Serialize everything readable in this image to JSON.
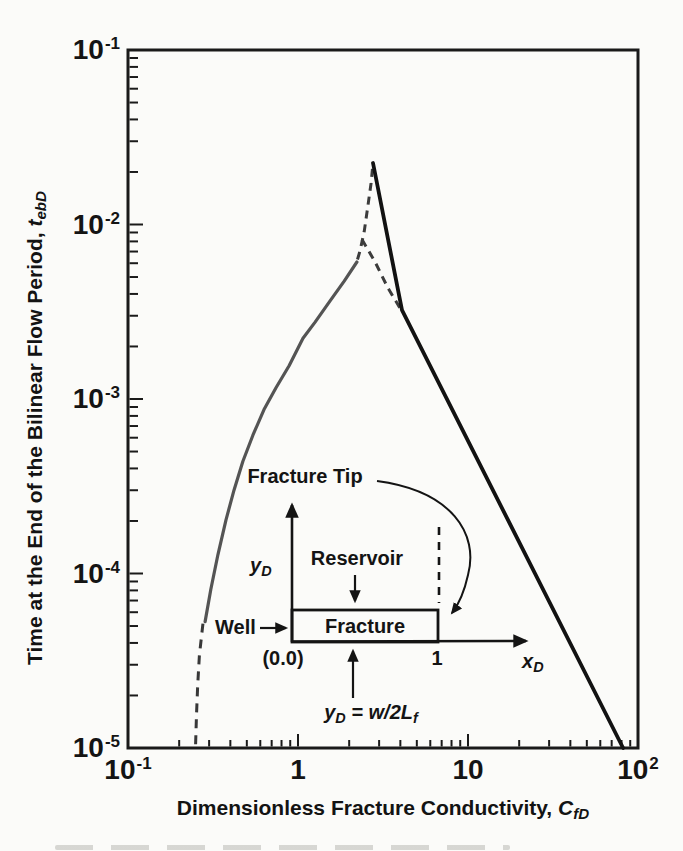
{
  "figure": {
    "x_title": "Dimensionless Fracture Conductivity, ",
    "x_title_symbol": "C",
    "x_title_subscript": "fD",
    "y_title": "Time at the End of the Bilinear Flow Period, ",
    "y_title_symbol": "t",
    "y_title_subscript": "ebD"
  },
  "chart_data": {
    "type": "line",
    "scale": "log-log",
    "grid": false,
    "legend": null,
    "title": "",
    "xlabel": "Dimensionless Fracture Conductivity, C_fD",
    "ylabel": "Time at the End of the Bilinear Flow Period, t_ebD",
    "xlim": [
      0.1,
      100
    ],
    "ylim": [
      1e-05,
      0.1
    ],
    "x_ticks": [
      {
        "value": 0.1,
        "base": "10",
        "exp": "-1"
      },
      {
        "value": 1,
        "base": "1",
        "exp": ""
      },
      {
        "value": 10,
        "base": "10",
        "exp": ""
      },
      {
        "value": 100,
        "base": "10",
        "exp": "2"
      }
    ],
    "y_ticks": [
      {
        "value": 0.1,
        "base": "10",
        "exp": "-1"
      },
      {
        "value": 0.01,
        "base": "10",
        "exp": "-2"
      },
      {
        "value": 0.001,
        "base": "10",
        "exp": "-3"
      },
      {
        "value": 0.0001,
        "base": "10",
        "exp": "-4"
      },
      {
        "value": 1e-05,
        "base": "10",
        "exp": "-5"
      }
    ],
    "key_points": {
      "peak": [
        2.76,
        0.0225
      ],
      "slope_change": [
        4.1,
        0.0032
      ],
      "right_branch_end": [
        82,
        1e-05
      ],
      "left_branch_bottom": [
        0.25,
        1.05e-05
      ]
    },
    "series": [
      {
        "name": "left-branch-dashed-extension",
        "line": "dashed",
        "dash": "9 7",
        "color": "#383838",
        "width": 3,
        "points": [
          [
            0.25,
            1.05e-05
          ],
          [
            0.253,
            1.55e-05
          ],
          [
            0.257,
            2.3e-05
          ],
          [
            0.263,
            3.4e-05
          ],
          [
            0.276,
            5.2e-05
          ]
        ]
      },
      {
        "name": "left-branch-solid",
        "line": "solid",
        "color": "#545454",
        "width": 3.2,
        "points": [
          [
            0.284,
            5.3e-05
          ],
          [
            0.307,
            8.1e-05
          ],
          [
            0.338,
            0.000128
          ],
          [
            0.377,
            0.000203
          ],
          [
            0.42,
            0.0003
          ],
          [
            0.474,
            0.00044
          ],
          [
            0.543,
            0.00062
          ],
          [
            0.631,
            0.00087
          ],
          [
            0.742,
            0.00116
          ],
          [
            0.887,
            0.00155
          ],
          [
            1.07,
            0.00223
          ],
          [
            1.26,
            0.00276
          ],
          [
            1.54,
            0.00364
          ],
          [
            1.87,
            0.00474
          ],
          [
            2.22,
            0.0061
          ]
        ]
      },
      {
        "name": "peak-rise-dashed",
        "line": "dashed",
        "dash": "8 6",
        "color": "#3c3c3c",
        "width": 3,
        "points": [
          [
            2.24,
            0.0063
          ],
          [
            2.32,
            0.0071
          ],
          [
            2.45,
            0.0091
          ],
          [
            2.58,
            0.0129
          ],
          [
            2.69,
            0.0173
          ],
          [
            2.76,
            0.0225
          ]
        ]
      },
      {
        "name": "peak-bypass-dashed",
        "line": "dashed",
        "dash": "8 6",
        "color": "#3c3c3c",
        "width": 3,
        "points": [
          [
            2.38,
            0.0082
          ],
          [
            2.84,
            0.0061
          ],
          [
            3.38,
            0.00433
          ],
          [
            3.98,
            0.00332
          ]
        ]
      },
      {
        "name": "right-branch-solid",
        "line": "solid",
        "color": "#121212",
        "width": 3.8,
        "points": [
          [
            2.76,
            0.0225
          ],
          [
            4.09,
            0.00323
          ],
          [
            81.7,
            1e-05
          ]
        ]
      }
    ]
  },
  "inset": {
    "fracture_tip_label": "Fracture Tip",
    "yd_symbol": "y",
    "yd_subscript": "D",
    "reservoir_label": "Reservoir",
    "well_label": "Well",
    "fracture_label": "Fracture",
    "origin_label": "(0.0)",
    "tip_coordinate_label": "1",
    "xd_symbol": "x",
    "xd_subscript": "D",
    "equation_lhs_symbol": "y",
    "equation_lhs_subscript": "D",
    "equation_rhs": " = w/2L",
    "equation_rhs_subscript": "f"
  }
}
